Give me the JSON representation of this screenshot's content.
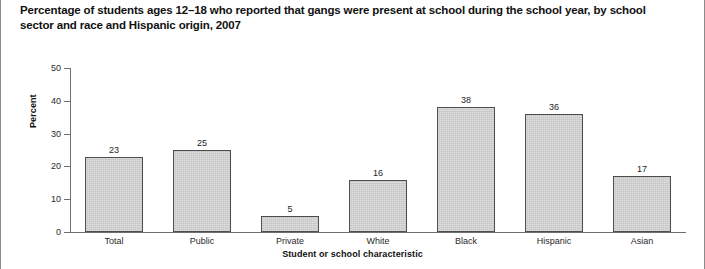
{
  "chart_data": {
    "type": "bar",
    "title": "Percentage of students ages 12–18 who reported that gangs were present at school during the school year, by school sector and race and Hispanic origin, 2007",
    "xlabel": "Student or school characteristic",
    "ylabel": "Percent",
    "categories": [
      "Total",
      "Public",
      "Private",
      "White",
      "Black",
      "Hispanic",
      "Asian"
    ],
    "values": [
      23,
      25,
      5,
      16,
      38,
      36,
      17
    ],
    "ylim": [
      0,
      50
    ],
    "yticks": [
      0,
      10,
      20,
      30,
      40,
      50
    ],
    "ytick_labels": [
      "0",
      "10",
      "20",
      "30",
      "40",
      "50"
    ],
    "grid": false,
    "legend": null,
    "bar_color": "#c3c3c3",
    "bar_edge_color": "#4d4d4d",
    "axis_color": "#6f6f6f",
    "data_labels": [
      "23",
      "25",
      "5",
      "16",
      "38",
      "36",
      "17"
    ]
  }
}
